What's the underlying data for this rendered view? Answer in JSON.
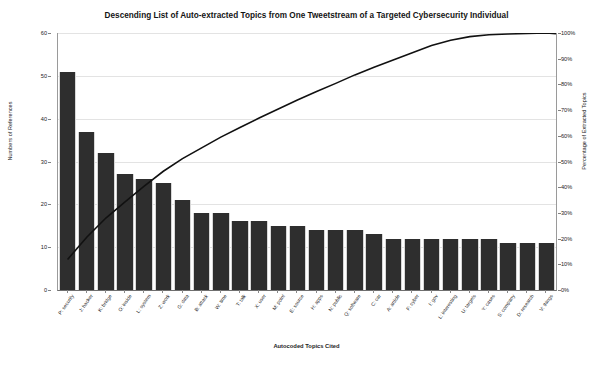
{
  "chart_data": {
    "type": "bar",
    "title": "Descending List of Auto-extracted Topics from One Tweetstream of a Targeted Cybersecurity Individual",
    "xlabel": "Autocoded Topics Cited",
    "ylabel": "Numbers of References",
    "ylabel_secondary": "Percentage of Extracted Topics",
    "ylim": [
      0,
      60
    ],
    "ylim_secondary": [
      0,
      100
    ],
    "ytick_labels": [
      "0",
      "10",
      "20",
      "30",
      "40",
      "50",
      "60"
    ],
    "ytick_values": [
      0,
      10,
      20,
      30,
      40,
      50,
      60
    ],
    "ytick_labels_secondary": [
      "0%",
      "10%",
      "20%",
      "30%",
      "40%",
      "50%",
      "60%",
      "70%",
      "80%",
      "90%",
      "100%"
    ],
    "ytick_values_secondary": [
      0,
      10,
      20,
      30,
      40,
      50,
      60,
      70,
      80,
      90,
      100
    ],
    "grid": true,
    "legend": "none",
    "categories": [
      "P: security",
      "J: hacker",
      "K: bridge",
      "O: inside",
      "L: system",
      "Z: work",
      "G: data",
      "B: attack",
      "W: time",
      "T: talk",
      "X: user",
      "M: point",
      "E: source",
      "H: apps",
      "N: public",
      "Q: software",
      "C: car",
      "A: article",
      "F: cyber",
      "I: gov",
      "L: interesting",
      "U: targets",
      "Y: cases",
      "S: company",
      "D: research",
      "V: things"
    ],
    "values": [
      51,
      37,
      32,
      27,
      26,
      25,
      21,
      18,
      18,
      16,
      16,
      15,
      15,
      14,
      14,
      14,
      13,
      12,
      12,
      12,
      12,
      12,
      12,
      11,
      11,
      11
    ],
    "series": [
      {
        "name": "Numbers of References",
        "type": "bar",
        "values": [
          51,
          37,
          32,
          27,
          26,
          25,
          21,
          18,
          18,
          16,
          16,
          15,
          15,
          14,
          14,
          14,
          13,
          12,
          12,
          12,
          12,
          12,
          12,
          11,
          11,
          11
        ]
      },
      {
        "name": "Cumulative Percentage of Extracted Topics",
        "type": "line",
        "axis": "secondary",
        "values": [
          11.9,
          20.5,
          28.0,
          34.3,
          40.4,
          46.2,
          51.1,
          55.3,
          59.5,
          63.2,
          66.9,
          70.4,
          73.9,
          77.2,
          80.4,
          83.7,
          86.7,
          89.5,
          92.3,
          95.1,
          97.2,
          98.6,
          99.3,
          99.6,
          99.8,
          100.0
        ]
      }
    ],
    "total_references": 429,
    "bar_color": "#2e2e2e",
    "line_color": "#111111",
    "grid_color": "#e3e3e3"
  }
}
